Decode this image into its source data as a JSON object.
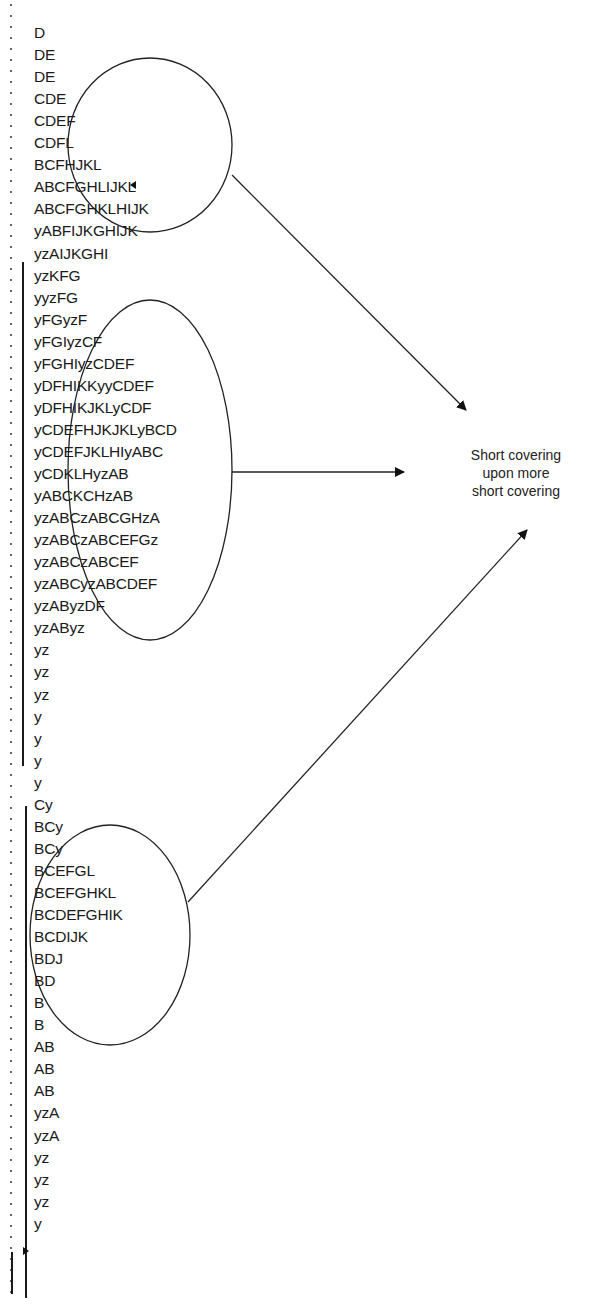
{
  "diagram": {
    "type": "market-profile",
    "rows": [
      "D",
      "DE",
      "DE",
      "CDE",
      "CDEF",
      "CDFL",
      "BCFHJKL",
      "ABCFGHLIJKL",
      "ABCFGHKLHIJK",
      "yABFIJKGHIJK",
      "yzAIJKGHI",
      "yzKFG",
      "yyzFG",
      "yFGyzF",
      "yFGIyzCF",
      "yFGHIyzCDEF",
      "yDFHIKKyyCDEF",
      "yDFHIKJKLyCDF",
      "yCDEFHJKJKLyBCD",
      "yCDEFJKLHIyABC",
      "yCDKLHyzAB",
      "yABCKCHzAB",
      "yzABCzABCGHzA",
      "yzABCzABCEFGz",
      "yzABCzABCEF",
      "yzABCyzABCDEF",
      "yzAByzDF",
      "yzAByz",
      "yz",
      "yz",
      "yz",
      "y",
      "y",
      "y",
      "y",
      "Cy",
      "BCy",
      "BCy",
      "BCEFGL",
      "BCEFGHKL",
      "BCDEFGHIK",
      "BCDIJK",
      "BDJ",
      "BD",
      "B",
      "B",
      "AB",
      "AB",
      "AB",
      "yzA",
      "yzA",
      "yz",
      "yz",
      "yz",
      "y"
    ],
    "annotation": {
      "line1": "Short covering",
      "line2": "upon more",
      "line3": "short covering"
    },
    "markers": {
      "left_arrow_row": "BCFHJKL",
      "right_arrow_row": "yz"
    },
    "highlighted_regions": [
      {
        "name": "upper-ellipse",
        "from_row": "CDE",
        "to_row": "yzAIJKGHI"
      },
      {
        "name": "middle-ellipse",
        "from_row": "yyzFG",
        "to_row": "yzAByzDF"
      },
      {
        "name": "lower-ellipse",
        "from_row": "Cy",
        "to_row": "BD"
      }
    ]
  }
}
